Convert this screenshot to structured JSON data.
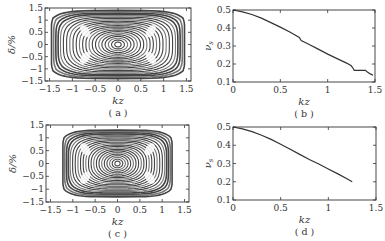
{
  "chart_data": [
    {
      "id": "a",
      "type": "scatter",
      "title": "",
      "panel_label": "( a )",
      "xlabel": "kz",
      "ylabel": "δ/%",
      "xlim": [
        -1.6,
        1.6
      ],
      "ylim": [
        -1.5,
        1.5
      ],
      "xticks": [
        "-1.5",
        "-1",
        "-0.5",
        "0",
        "0.5",
        "1",
        "1.5"
      ],
      "yticks": [
        "1.5",
        "1",
        "0.5",
        "0",
        "-0.5",
        "-1",
        "-1.5"
      ],
      "description": "Poincaré-style phase-space orbits: nested closed curves centred at (0,0), filling nearly the full box out to |kz|≈1.5, |δ|≈1.4, with island chains near |kz|≈0.7",
      "max_orbit": {
        "kz_half_width": 1.55,
        "delta_half_height": 1.4
      }
    },
    {
      "id": "b",
      "type": "line",
      "title": "",
      "panel_label": "( b )",
      "xlabel": "kz",
      "ylabel": "ν_s",
      "xlim": [
        0,
        1.5
      ],
      "ylim": [
        0.1,
        0.5
      ],
      "xticks": [
        "0",
        "0.5",
        "1",
        "1.5"
      ],
      "yticks": [
        "0.5",
        "0.4",
        "0.3",
        "0.2",
        "0.1"
      ],
      "x": [
        0,
        0.1,
        0.2,
        0.3,
        0.4,
        0.5,
        0.6,
        0.7,
        0.72,
        0.8,
        0.9,
        1.0,
        1.1,
        1.2,
        1.25,
        1.27,
        1.28,
        1.4,
        1.42,
        1.45,
        1.48
      ],
      "values": [
        0.5,
        0.49,
        0.475,
        0.455,
        0.43,
        0.405,
        0.378,
        0.348,
        0.33,
        0.31,
        0.283,
        0.255,
        0.23,
        0.205,
        0.19,
        0.175,
        0.165,
        0.165,
        0.155,
        0.145,
        0.137
      ]
    },
    {
      "id": "c",
      "type": "scatter",
      "title": "",
      "panel_label": "( c )",
      "xlabel": "kz",
      "ylabel": "δ/%",
      "xlim": [
        -1.6,
        1.6
      ],
      "ylim": [
        -1.5,
        1.5
      ],
      "xticks": [
        "-1.5",
        "-1",
        "-0.5",
        "0",
        "0.5",
        "1",
        "1.5"
      ],
      "yticks": [
        "1.5",
        "1",
        "0.5",
        "0",
        "-0.5",
        "-1",
        "-1.5"
      ],
      "description": "Nested closed phase-space orbits centred at (0,0), outermost reaching |kz|≈1.3, |δ|≈1.3, with island chains near |kz|≈0.7",
      "max_orbit": {
        "kz_half_width": 1.3,
        "delta_half_height": 1.3
      }
    },
    {
      "id": "d",
      "type": "line",
      "title": "",
      "panel_label": "( d )",
      "xlabel": "kz",
      "ylabel": "ν_s",
      "xlim": [
        0,
        1.5
      ],
      "ylim": [
        0.1,
        0.5
      ],
      "xticks": [
        "0",
        "0.5",
        "1",
        "1.5"
      ],
      "yticks": [
        "0.5",
        "0.4",
        "0.3",
        "0.2",
        "0.1"
      ],
      "x": [
        0,
        0.1,
        0.2,
        0.3,
        0.4,
        0.5,
        0.6,
        0.7,
        0.8,
        0.9,
        1.0,
        1.1,
        1.2,
        1.25
      ],
      "values": [
        0.5,
        0.49,
        0.475,
        0.455,
        0.432,
        0.405,
        0.378,
        0.35,
        0.322,
        0.297,
        0.27,
        0.243,
        0.215,
        0.2
      ]
    }
  ]
}
